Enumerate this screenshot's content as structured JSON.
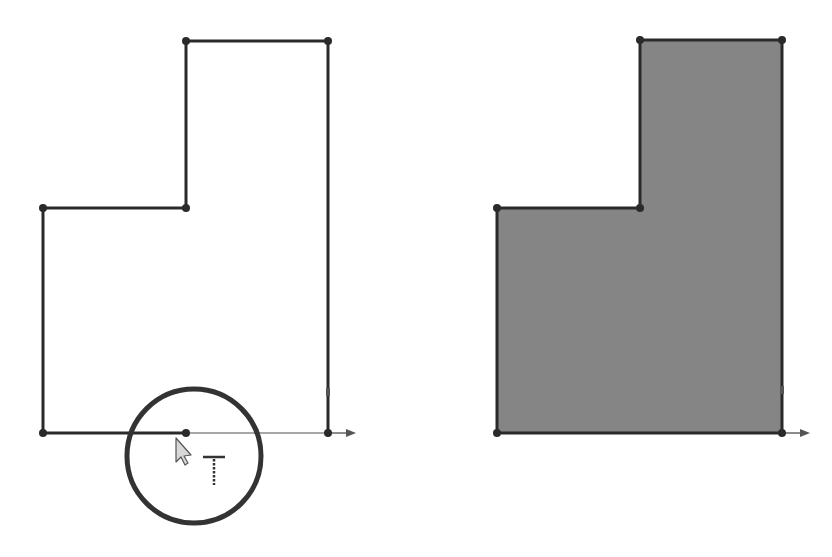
{
  "colors": {
    "background": "#ffffff",
    "sketch_line": "#2a2a2a",
    "construction_line": "#8a8a8a",
    "fill": "#858585",
    "circle": "#333333",
    "cursor_fill": "#d8d8d8",
    "cursor_stroke": "#555555"
  },
  "panels": [
    {
      "id": "open-sketch",
      "description": "L-shaped sketch profile with open segment being closed",
      "vertices": [
        [
          43,
          433
        ],
        [
          43,
          208
        ],
        [
          186,
          208
        ],
        [
          186,
          41
        ],
        [
          328,
          41
        ],
        [
          328,
          433
        ]
      ],
      "closing_segment": {
        "from": [
          186,
          433
        ],
        "to": [
          328,
          433
        ]
      },
      "drawn_bottom_segment": {
        "from": [
          43,
          433
        ],
        "to": [
          186,
          433
        ]
      },
      "endpoint_markers": [
        [
          43,
          208
        ],
        [
          186,
          208
        ],
        [
          186,
          41
        ],
        [
          328,
          41
        ],
        [
          328,
          433
        ],
        [
          43,
          433
        ],
        [
          186,
          433
        ]
      ],
      "axis_arrow": {
        "origin": [
          328,
          433
        ],
        "tip": [
          356,
          433
        ]
      },
      "vertical_marker": [
        328,
        392
      ]
    },
    {
      "id": "closed-region",
      "description": "L-shaped closed sketch region shaded",
      "vertices": [
        [
          497,
          433
        ],
        [
          497,
          208
        ],
        [
          640,
          208
        ],
        [
          640,
          40
        ],
        [
          782,
          40
        ],
        [
          782,
          433
        ]
      ],
      "endpoint_markers": [
        [
          497,
          208
        ],
        [
          640,
          208
        ],
        [
          640,
          40
        ],
        [
          782,
          40
        ],
        [
          782,
          433
        ],
        [
          497,
          433
        ]
      ],
      "axis_arrow": {
        "origin": [
          782,
          433
        ],
        "tip": [
          810,
          433
        ]
      },
      "vertical_marker": [
        782,
        390
      ]
    }
  ],
  "highlight_circle": {
    "cx": 194,
    "cy": 456,
    "r": 67
  },
  "cursor": {
    "x": 176,
    "y": 438,
    "icon": "arrow-pointer-icon"
  },
  "cursor_badge": {
    "icon": "coincident-t-icon",
    "x": 203,
    "y": 457
  }
}
